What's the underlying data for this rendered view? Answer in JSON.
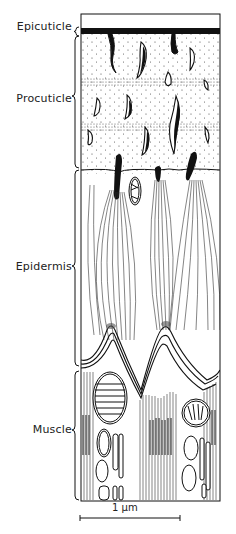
{
  "diagram": {
    "layers": [
      {
        "id": "epicuticle",
        "label": "Epicuticle",
        "label_y": 26
      },
      {
        "id": "procuticle",
        "label": "Procuticle",
        "label_y": 93
      },
      {
        "id": "epidermis",
        "label": "Epidermis",
        "label_y": 262
      },
      {
        "id": "muscle",
        "label": "Muscle",
        "label_y": 429
      }
    ],
    "scale_bar": {
      "label": "1 µm",
      "length_px": 100
    },
    "colors": {
      "ink": "#111111",
      "paper": "#ffffff"
    }
  }
}
